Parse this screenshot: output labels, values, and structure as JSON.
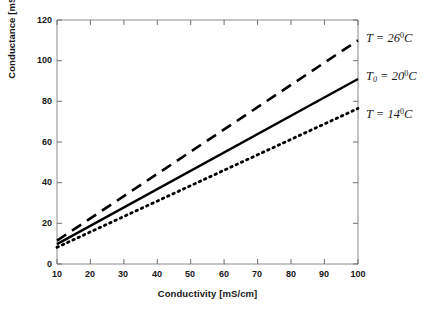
{
  "chart_data": {
    "type": "line",
    "title": "",
    "xlabel": "Conductivity [mS/cm]",
    "ylabel": "Conductance [mS]",
    "xlim": [
      10,
      100
    ],
    "ylim": [
      0,
      120
    ],
    "xticks": [
      10,
      20,
      30,
      40,
      50,
      60,
      70,
      80,
      90,
      100
    ],
    "yticks": [
      0,
      20,
      40,
      60,
      80,
      100,
      120
    ],
    "grid": false,
    "legend_position": "right-of-axes-annotations",
    "x": [
      10,
      100
    ],
    "series": [
      {
        "name": "T = 26 0 C",
        "label_text": "T",
        "label_sub": "",
        "label_value": "26",
        "label_sup": "0",
        "label_unit": "C",
        "style": "dashed",
        "color": "#000000",
        "values": [
          11.5,
          110
        ]
      },
      {
        "name": "T0 = 20 0 C",
        "label_text": "T",
        "label_sub": "0",
        "label_value": "20",
        "label_sup": "0",
        "label_unit": "C",
        "style": "solid",
        "color": "#000000",
        "values": [
          9.8,
          91
        ]
      },
      {
        "name": "T = 14 0 C",
        "label_text": "T",
        "label_sub": "",
        "label_value": "14",
        "label_sup": "0",
        "label_unit": "C",
        "style": "dotted",
        "color": "#000000",
        "values": [
          8.2,
          76.5
        ]
      }
    ]
  },
  "axes": {
    "frame_color": "#8a8a8a",
    "tick_color": "#6f6f6f"
  }
}
